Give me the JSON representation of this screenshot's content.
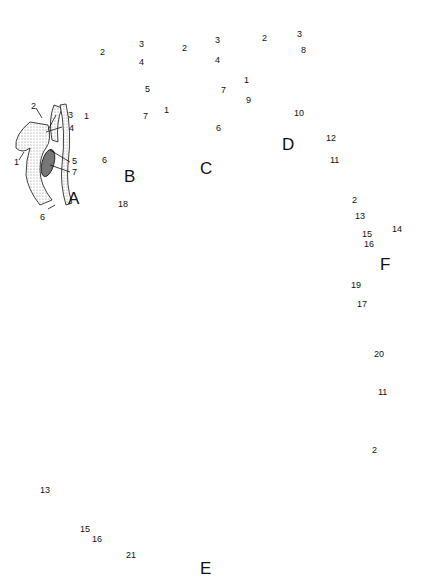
{
  "figure": {
    "panels": [
      {
        "id": "A",
        "label": "A",
        "labels": [
          "1",
          "2",
          "3",
          "4",
          "5",
          "6",
          "7"
        ]
      },
      {
        "id": "B",
        "label": "B",
        "labels": [
          "1",
          "2",
          "3",
          "4",
          "5",
          "6",
          "7"
        ]
      },
      {
        "id": "C",
        "label": "C",
        "labels": [
          "1",
          "2",
          "3",
          "4",
          "6",
          "7"
        ]
      },
      {
        "id": "D",
        "label": "D",
        "labels": [
          "1",
          "2",
          "3",
          "8",
          "9",
          "10"
        ]
      },
      {
        "id": "E",
        "label": "E",
        "labels": [
          "2",
          "11",
          "13",
          "15",
          "16",
          "17",
          "18",
          "19",
          "20",
          "21"
        ]
      },
      {
        "id": "F",
        "label": "F",
        "labels": [
          "2",
          "11",
          "12",
          "13",
          "14",
          "15",
          "16"
        ]
      }
    ],
    "colors": {
      "ink": "#111111",
      "stipple": "#bdbdbd",
      "dark_fill": "#6a6a6a",
      "background": "#ffffff"
    }
  },
  "A": {
    "title": "A",
    "l1": "1",
    "l2": "2",
    "l3": "3",
    "l4": "4",
    "l5": "5",
    "l6": "6",
    "l7": "7"
  },
  "B": {
    "title": "B",
    "l1": "1",
    "l2": "2",
    "l3": "3",
    "l4": "4",
    "l5": "5",
    "l6": "6",
    "l7": "7"
  },
  "C": {
    "title": "C",
    "l1": "1",
    "l2": "2",
    "l3": "3",
    "l4": "4",
    "l6": "6",
    "l7": "7"
  },
  "D": {
    "title": "D",
    "l1": "1",
    "l2": "2",
    "l3": "3",
    "l8": "8",
    "l9": "9",
    "l10": "10"
  },
  "E": {
    "title": "E",
    "l2": "2",
    "l11": "11",
    "l13": "13",
    "l15": "15",
    "l16": "16",
    "l17": "17",
    "l18": "18",
    "l19": "19",
    "l20": "20",
    "l21": "21"
  },
  "F": {
    "title": "F",
    "l2": "2",
    "l11": "11",
    "l12": "12",
    "l13": "13",
    "l14": "14",
    "l15": "15",
    "l16": "16"
  }
}
